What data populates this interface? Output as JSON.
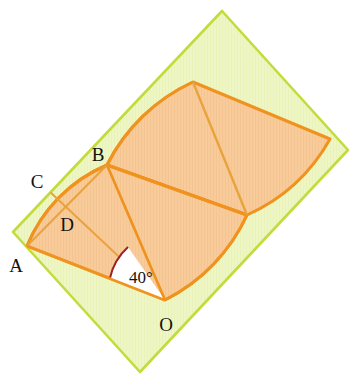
{
  "figure": {
    "type": "geometry-diagram",
    "canvas": {
      "width": 360,
      "height": 385,
      "background": "#ffffff"
    },
    "colors": {
      "rectangle_fill": "#eef6c6",
      "rectangle_stroke": "#c3dc3c",
      "sector_fill": "#f8cb9b",
      "sector_stroke": "#f0931e",
      "chord_stroke": "#e8a33d",
      "angle_arc": "#9b2222",
      "angle_wedge_fill": "#ffffff",
      "label_color": "#14120f"
    },
    "rectangle": {
      "name": "green-rectangle",
      "corners": [
        {
          "x": 222,
          "y": 11
        },
        {
          "x": 348,
          "y": 150
        },
        {
          "x": 140,
          "y": 372
        },
        {
          "x": 13,
          "y": 232
        }
      ]
    },
    "points": [
      {
        "id": "A",
        "label": "A",
        "x": 27,
        "y": 246,
        "label_x": 16,
        "label_y": 272
      },
      {
        "id": "B",
        "label": "B",
        "x": 107,
        "y": 165,
        "label_x": 96,
        "label_y": 161
      },
      {
        "id": "C",
        "label": "C",
        "x": 49,
        "y": 191,
        "label_x": 34,
        "label_y": 187
      },
      {
        "id": "D",
        "label": "D",
        "x": 80,
        "y": 215,
        "label_x": 62,
        "label_y": 229
      },
      {
        "id": "O",
        "label": "O",
        "x": 165,
        "y": 300,
        "label_x": 159,
        "label_y": 330
      }
    ],
    "angle": {
      "name": "angle-at-O",
      "value": 40,
      "label": "40°",
      "vertex": "O",
      "label_x": 121,
      "label_y": 283,
      "arc_radius": 56
    },
    "sectors": [
      {
        "name": "lower-left-sector",
        "center": "O",
        "radius": 180,
        "arc_from": "A",
        "arc_to": "B",
        "chords": [
          "O-A",
          "O-B",
          "C-D",
          "A-B"
        ]
      },
      {
        "name": "upper-right-sector",
        "center": "B",
        "radius": 178,
        "chords": [
          "B-top",
          "B-right"
        ]
      }
    ]
  }
}
